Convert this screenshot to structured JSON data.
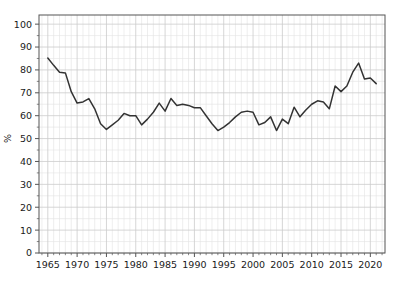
{
  "chart_data": {
    "type": "line",
    "title": "",
    "subtitle": "",
    "xlabel": "",
    "ylabel": "%",
    "xlim": [
      1963.5,
      2022.5
    ],
    "ylim": [
      0,
      104
    ],
    "grid": true,
    "grid_minor": true,
    "legend": "none",
    "line_color": "#333333",
    "grid_color": "#cccccc",
    "grid_minor_color": "#e2e2e2",
    "axis_color": "#555555",
    "background_color": "#ffffff",
    "x_ticks": [
      1965,
      1970,
      1975,
      1980,
      1985,
      1990,
      1995,
      2000,
      2005,
      2010,
      2015,
      2020
    ],
    "x_tick_labels": [
      "1965",
      "1970",
      "1975",
      "1980",
      "1985",
      "1990",
      "1995",
      "2000",
      "2005",
      "2010",
      "2015",
      "2020"
    ],
    "y_ticks": [
      0,
      10,
      20,
      30,
      40,
      50,
      60,
      70,
      80,
      90,
      100
    ],
    "y_tick_labels": [
      "0",
      "10",
      "20",
      "30",
      "40",
      "50",
      "60",
      "70",
      "80",
      "90",
      "100"
    ],
    "x": [
      1965,
      1966,
      1967,
      1968,
      1969,
      1970,
      1971,
      1972,
      1973,
      1974,
      1975,
      1976,
      1977,
      1978,
      1979,
      1980,
      1981,
      1982,
      1983,
      1984,
      1985,
      1986,
      1987,
      1988,
      1989,
      1990,
      1991,
      1992,
      1993,
      1994,
      1995,
      1996,
      1997,
      1998,
      1999,
      2000,
      2001,
      2002,
      2003,
      2004,
      2005,
      2006,
      2007,
      2008,
      2009,
      2010,
      2011,
      2012,
      2013,
      2014,
      2015,
      2016,
      2017,
      2018,
      2019,
      2020,
      2021
    ],
    "series": [
      {
        "name": "%",
        "values": [
          85.2,
          82.0,
          79.0,
          78.7,
          70.5,
          65.5,
          66.0,
          67.5,
          63.0,
          56.5,
          54.0,
          56.0,
          58.0,
          61.0,
          60.0,
          60.0,
          56.0,
          58.5,
          61.5,
          65.5,
          62.0,
          67.5,
          64.5,
          65.0,
          64.5,
          63.5,
          63.5,
          60.0,
          56.5,
          53.5,
          55.0,
          57.0,
          59.5,
          61.5,
          62.0,
          61.5,
          56.0,
          57.0,
          59.5,
          53.5,
          58.5,
          56.5,
          63.7,
          59.5,
          62.5,
          65.0,
          66.5,
          66.0,
          63.0,
          73.0,
          70.5,
          73.0,
          79.0,
          83.0,
          76.0,
          76.5,
          74.0
        ]
      }
    ]
  }
}
